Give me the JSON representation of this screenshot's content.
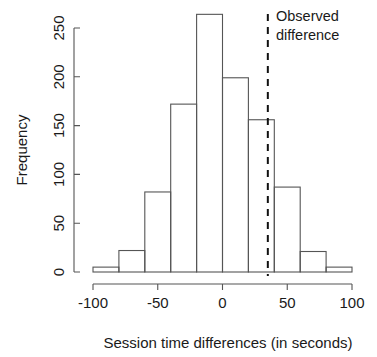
{
  "chart_data": {
    "type": "bar",
    "title": "",
    "subtitle": "",
    "xlabel": "Session time differences (in seconds)",
    "ylabel": "Frequency",
    "xlim": [
      -100,
      100
    ],
    "ylim": [
      0,
      265
    ],
    "grid": false,
    "legend": null,
    "bin_width": 20,
    "bin_edges": [
      -100,
      -80,
      -60,
      -40,
      -20,
      0,
      20,
      40,
      60,
      80,
      100
    ],
    "categories": [
      "-100 to -80",
      "-80 to -60",
      "-60 to -40",
      "-40 to -20",
      "-20 to 0",
      "0 to 20",
      "20 to 40",
      "40 to 60",
      "60 to 80",
      "80 to 100"
    ],
    "values": [
      5,
      22,
      82,
      172,
      264,
      199,
      156,
      87,
      21,
      5
    ],
    "xticks": [
      -100,
      -50,
      0,
      50,
      100
    ],
    "xtick_labels": [
      "-100",
      "-50",
      "0",
      "50",
      "100"
    ],
    "yticks": [
      0,
      50,
      100,
      150,
      200,
      250
    ],
    "ytick_labels": [
      "0",
      "50",
      "100",
      "150",
      "200",
      "250"
    ],
    "annotations": [
      {
        "name": "observed-difference",
        "kind": "vertical-dashed-line",
        "x": 35,
        "label_line1": "Observed",
        "label_line2": "difference",
        "color": "#111111"
      }
    ]
  },
  "style": {
    "bar_stroke": "#555555",
    "axis_color": "#555555",
    "text_color": "#1a1a1a",
    "background": "#ffffff"
  }
}
